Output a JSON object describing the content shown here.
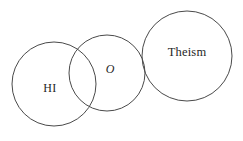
{
  "diagram": {
    "type": "venn-three-circle",
    "background_color": "#ffffff",
    "stroke_color": "#4a4a4a",
    "text_color": "#262626",
    "canvas": {
      "width": 243,
      "height": 141
    },
    "circles": [
      {
        "id": "hi",
        "label": "HI",
        "label_style": "normal",
        "cx": 54,
        "cy": 84,
        "r": 42,
        "label_x": 50,
        "label_y": 89
      },
      {
        "id": "o",
        "label": "O",
        "label_style": "italic",
        "cx": 107,
        "cy": 73,
        "r": 38,
        "label_x": 110,
        "label_y": 70
      },
      {
        "id": "theism",
        "label": "Theism",
        "label_style": "normal",
        "cx": 187,
        "cy": 56,
        "r": 45,
        "label_x": 187,
        "label_y": 53
      }
    ]
  }
}
